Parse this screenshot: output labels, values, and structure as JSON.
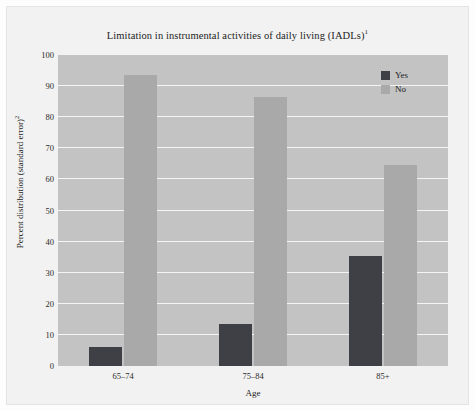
{
  "figure": {
    "title": "Limitation in instrumental activities of daily living (IADLs)",
    "title_superscript": "1"
  },
  "legend": {
    "position": "top-right",
    "items": [
      {
        "label": "Yes",
        "color": "#3f4045",
        "swatch_name": "legend-swatch-yes"
      },
      {
        "label": "No",
        "color": "#a9a9a9",
        "swatch_name": "legend-swatch-no"
      }
    ]
  },
  "axes": {
    "y": {
      "label": "Percent distribution (standard error)",
      "label_superscript": "2",
      "ticks": [
        "0",
        "10",
        "20",
        "30",
        "40",
        "50",
        "60",
        "70",
        "80",
        "90",
        "100"
      ],
      "min": 0,
      "max": 100
    },
    "x": {
      "label": "Age",
      "ticks": [
        "65–74",
        "75–84",
        "85+"
      ]
    }
  },
  "colors": {
    "plot_background": "#c3c3c3",
    "gridline": "#f4f4f4",
    "frame_background": "#f2f2f2",
    "yes_bar": "#3f4045",
    "no_bar": "#a9a9a9"
  },
  "chart_data": {
    "type": "bar",
    "xlabel": "Age",
    "ylabel": "Percent distribution (standard error)²",
    "categories": [
      "65–74",
      "75–84",
      "85+"
    ],
    "series": [
      {
        "name": "Yes",
        "color": "#3f4045",
        "values": [
          6.0,
          13.5,
          35.5
        ]
      },
      {
        "name": "No",
        "color": "#a9a9a9",
        "values": [
          93.5,
          86.5,
          64.5
        ]
      }
    ],
    "ylim": [
      0,
      100
    ],
    "ytick_step": 10,
    "grid": true,
    "legend_position": "top-right"
  }
}
